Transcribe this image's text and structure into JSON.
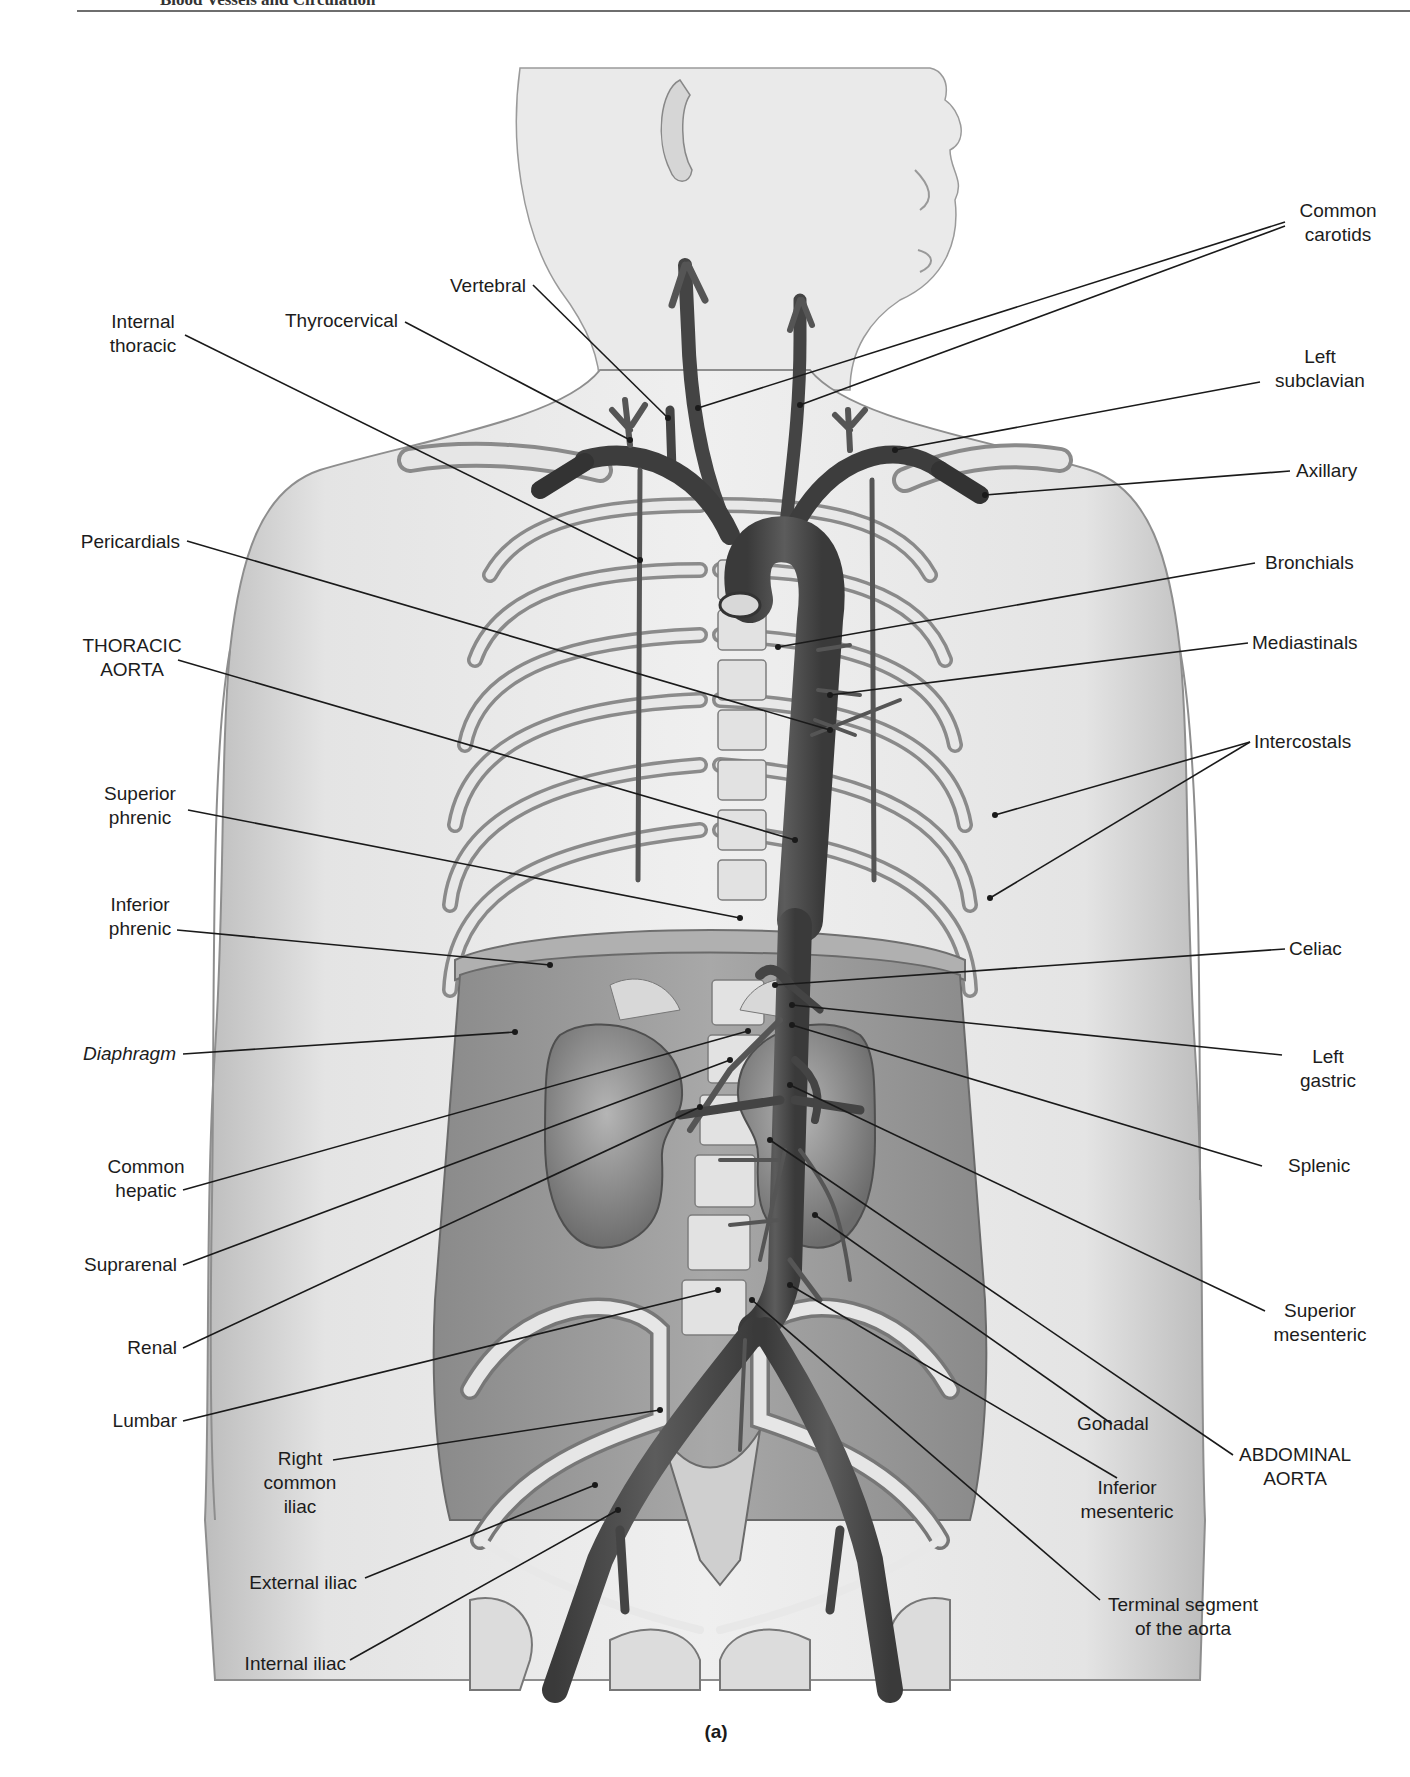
{
  "header": {
    "running_title": "Blood Vessels and Circulation"
  },
  "figure": {
    "caption": "(a)",
    "colors": {
      "skin": "#e6e6e6",
      "body_cavity": "#9a9a9a",
      "artery": "#4a4a4a",
      "bone": "#d9d9d9",
      "leader_line": "#1a1a1a"
    }
  },
  "labels": {
    "left": [
      {
        "id": "internal-thoracic",
        "lines": [
          "Internal",
          "thoracic"
        ]
      },
      {
        "id": "thyrocervical",
        "lines": [
          "Thyrocervical"
        ]
      },
      {
        "id": "vertebral",
        "lines": [
          "Vertebral"
        ]
      },
      {
        "id": "pericardials",
        "lines": [
          "Pericardials"
        ]
      },
      {
        "id": "thoracic-aorta",
        "lines": [
          "THORACIC",
          "AORTA"
        ]
      },
      {
        "id": "superior-phrenic",
        "lines": [
          "Superior",
          "phrenic"
        ]
      },
      {
        "id": "inferior-phrenic",
        "lines": [
          "Inferior",
          "phrenic"
        ]
      },
      {
        "id": "diaphragm",
        "lines": [
          "Diaphragm"
        ],
        "italic": true
      },
      {
        "id": "common-hepatic",
        "lines": [
          "Common",
          "hepatic"
        ]
      },
      {
        "id": "suprarenal",
        "lines": [
          "Suprarenal"
        ]
      },
      {
        "id": "renal",
        "lines": [
          "Renal"
        ]
      },
      {
        "id": "lumbar",
        "lines": [
          "Lumbar"
        ]
      },
      {
        "id": "right-common-iliac",
        "lines": [
          "Right",
          "common",
          "iliac"
        ]
      },
      {
        "id": "external-iliac",
        "lines": [
          "External iliac"
        ]
      },
      {
        "id": "internal-iliac",
        "lines": [
          "Internal iliac"
        ]
      }
    ],
    "right": [
      {
        "id": "common-carotids",
        "lines": [
          "Common",
          "carotids"
        ]
      },
      {
        "id": "left-subclavian",
        "lines": [
          "Left",
          "subclavian"
        ]
      },
      {
        "id": "axillary",
        "lines": [
          "Axillary"
        ]
      },
      {
        "id": "bronchials",
        "lines": [
          "Bronchials"
        ]
      },
      {
        "id": "mediastinals",
        "lines": [
          "Mediastinals"
        ]
      },
      {
        "id": "intercostals",
        "lines": [
          "Intercostals"
        ]
      },
      {
        "id": "celiac",
        "lines": [
          "Celiac"
        ]
      },
      {
        "id": "left-gastric",
        "lines": [
          "Left",
          "gastric"
        ]
      },
      {
        "id": "splenic",
        "lines": [
          "Splenic"
        ]
      },
      {
        "id": "superior-mesenteric",
        "lines": [
          "Superior",
          "mesenteric"
        ]
      },
      {
        "id": "gonadal",
        "lines": [
          "Gonadal"
        ]
      },
      {
        "id": "abdominal-aorta",
        "lines": [
          "ABDOMINAL",
          "AORTA"
        ]
      },
      {
        "id": "inferior-mesenteric",
        "lines": [
          "Inferior",
          "mesenteric"
        ]
      },
      {
        "id": "terminal-segment",
        "lines": [
          "Terminal segment",
          "of the aorta"
        ]
      }
    ]
  },
  "text": {
    "internal_thoracic": "Internal\nthoracic",
    "thyrocervical": "Thyrocervical",
    "vertebral": "Vertebral",
    "pericardials": "Pericardials",
    "thoracic_aorta": "THORACIC\nAORTA",
    "superior_phrenic": "Superior\nphrenic",
    "inferior_phrenic": "Inferior\nphrenic",
    "diaphragm": "Diaphragm",
    "common_hepatic": "Common\nhepatic",
    "suprarenal": "Suprarenal",
    "renal": "Renal",
    "lumbar": "Lumbar",
    "right_common_iliac": "Right\ncommon\niliac",
    "external_iliac": "External iliac",
    "internal_iliac": "Internal iliac",
    "common_carotids": "Common\ncarotids",
    "left_subclavian": "Left\nsubclavian",
    "axillary": "Axillary",
    "bronchials": "Bronchials",
    "mediastinals": "Mediastinals",
    "intercostals": "Intercostals",
    "celiac": "Celiac",
    "left_gastric": "Left\ngastric",
    "splenic": "Splenic",
    "superior_mesenteric": "Superior\nmesenteric",
    "gonadal": "Gonadal",
    "abdominal_aorta": "ABDOMINAL\nAORTA",
    "inferior_mesenteric": "Inferior\nmesenteric",
    "terminal_segment": "Terminal segment\nof the aorta"
  }
}
